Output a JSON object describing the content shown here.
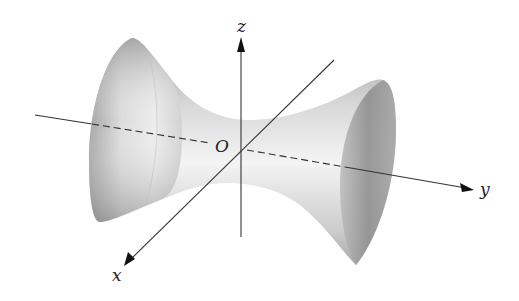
{
  "figure": {
    "surface": "hyperboloid-of-one-sheet",
    "colors": {
      "background": "#ffffff",
      "axis": "#333333",
      "surface_dark": "#8a8a8a",
      "surface_light": "#f2f2f2"
    },
    "labels": {
      "z_axis": "z",
      "y_axis": "y",
      "x_axis": "x",
      "origin": "O"
    }
  }
}
